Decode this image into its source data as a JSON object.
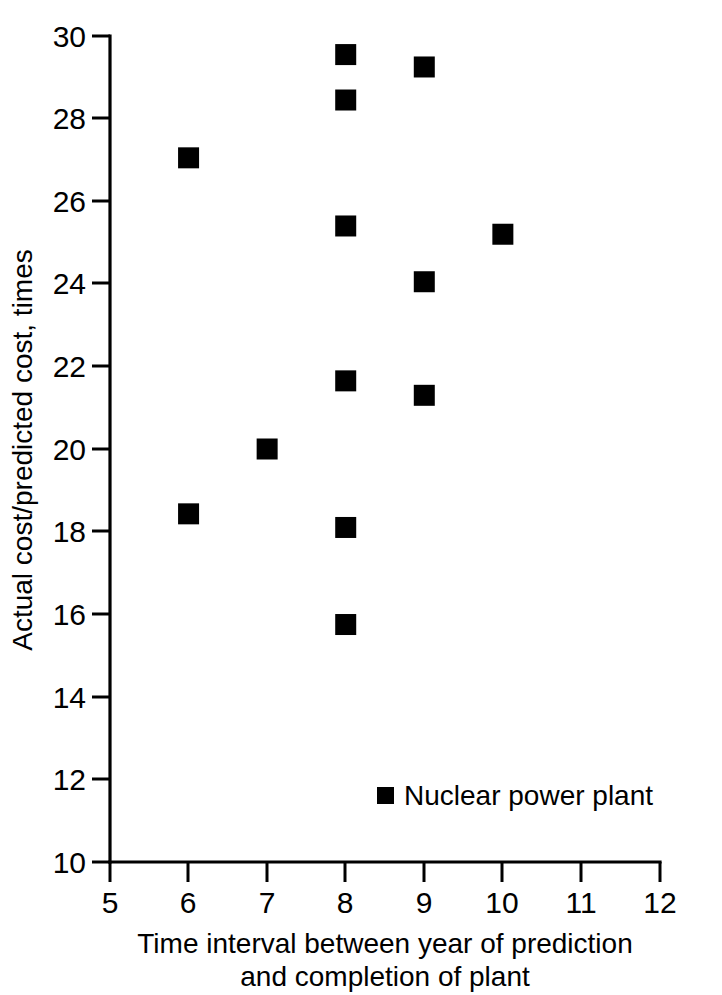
{
  "chart_data": {
    "type": "scatter",
    "title": "",
    "xlabel": "Time interval between year of prediction and completion of plant",
    "xlabel_line1": "Time interval between year of prediction",
    "xlabel_line2": "and completion of plant",
    "ylabel": "Actual cost/predicted cost, times",
    "xlim": [
      5,
      12
    ],
    "ylim": [
      10,
      30
    ],
    "xticks": [
      5,
      6,
      7,
      8,
      9,
      10,
      11,
      12
    ],
    "xtick_labels": [
      "5",
      "6",
      "7",
      "8",
      "9",
      "10",
      "11",
      "12"
    ],
    "yticks": [
      10,
      12,
      14,
      16,
      18,
      20,
      22,
      24,
      26,
      28,
      30
    ],
    "ytick_labels": [
      "10",
      "12",
      "14",
      "16",
      "18",
      "20",
      "22",
      "24",
      "26",
      "28",
      "30"
    ],
    "grid": false,
    "legend_position": "inside-lower-right",
    "marker_style": "filled-square",
    "marker_color": "#000000",
    "series": [
      {
        "name": "Nuclear power plant",
        "points": [
          {
            "x": 6,
            "y": 27.05
          },
          {
            "x": 6,
            "y": 18.43
          },
          {
            "x": 7,
            "y": 20.0
          },
          {
            "x": 8,
            "y": 29.55
          },
          {
            "x": 8,
            "y": 28.45
          },
          {
            "x": 8,
            "y": 25.4
          },
          {
            "x": 8,
            "y": 21.65
          },
          {
            "x": 8,
            "y": 18.1
          },
          {
            "x": 8,
            "y": 15.75
          },
          {
            "x": 9,
            "y": 29.25
          },
          {
            "x": 9,
            "y": 24.05
          },
          {
            "x": 9,
            "y": 21.3
          },
          {
            "x": 10,
            "y": 25.2
          }
        ]
      }
    ],
    "annotations": []
  },
  "legend": {
    "entries": [
      {
        "label": "Nuclear power plant",
        "marker": "filled-square",
        "color": "#000000"
      }
    ]
  },
  "axes": {
    "x_title_line1": "Time interval between year of prediction",
    "x_title_line2": "and completion of plant",
    "y_title": "Actual cost/predicted cost, times"
  }
}
